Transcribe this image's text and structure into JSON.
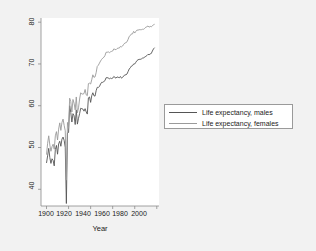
{
  "chart_data": {
    "type": "line",
    "title": "",
    "subtitle": "",
    "xlabel": "Year",
    "ylabel": "",
    "xlim": [
      1895,
      2002
    ],
    "ylim": [
      36,
      81
    ],
    "grid": false,
    "legend_position": "right",
    "xticks": [
      1900,
      1920,
      1940,
      1960,
      1980,
      2000
    ],
    "yticks": [
      40,
      50,
      60,
      70,
      80
    ],
    "xtick_labels": [
      "1900",
      "1920",
      "1940",
      "1960",
      "1980",
      "2000"
    ],
    "ytick_labels": [
      "40",
      "50",
      "60",
      "70",
      "80"
    ],
    "series": [
      {
        "name": "Life expectancy, males",
        "color": "#555555",
        "x": [
          1900,
          1901,
          1902,
          1903,
          1904,
          1905,
          1906,
          1907,
          1908,
          1909,
          1910,
          1911,
          1912,
          1913,
          1914,
          1915,
          1916,
          1917,
          1918,
          1919,
          1920,
          1921,
          1922,
          1923,
          1924,
          1925,
          1926,
          1927,
          1928,
          1929,
          1930,
          1931,
          1932,
          1933,
          1934,
          1935,
          1936,
          1937,
          1938,
          1939,
          1940,
          1941,
          1942,
          1943,
          1944,
          1945,
          1946,
          1947,
          1948,
          1949,
          1950,
          1951,
          1952,
          1953,
          1954,
          1955,
          1956,
          1957,
          1958,
          1959,
          1960,
          1961,
          1962,
          1963,
          1964,
          1965,
          1966,
          1967,
          1968,
          1969,
          1970,
          1971,
          1972,
          1973,
          1974,
          1975,
          1976,
          1977,
          1978,
          1979,
          1980,
          1981,
          1982,
          1983,
          1984,
          1985,
          1986,
          1987,
          1988,
          1989,
          1990,
          1991,
          1992,
          1993,
          1994,
          1995,
          1996,
          1997,
          1998
        ],
        "y": [
          46.3,
          48.0,
          49.8,
          47.6,
          46.2,
          47.3,
          46.9,
          45.6,
          49.5,
          50.5,
          48.4,
          50.9,
          51.5,
          50.3,
          52.0,
          52.5,
          51.7,
          50.0,
          36.6,
          53.5,
          53.6,
          60.0,
          58.4,
          56.1,
          58.1,
          57.6,
          55.5,
          59.0,
          55.6,
          57.0,
          58.1,
          59.4,
          59.3,
          59.2,
          58.7,
          59.3,
          58.5,
          58.0,
          61.9,
          62.1,
          60.8,
          62.4,
          63.1,
          62.4,
          62.3,
          63.6,
          64.4,
          64.4,
          64.6,
          65.2,
          65.6,
          65.6,
          65.8,
          66.0,
          66.7,
          66.7,
          66.7,
          66.4,
          66.6,
          66.5,
          66.6,
          67.0,
          66.8,
          66.6,
          66.9,
          66.8,
          66.7,
          67.0,
          66.6,
          66.8,
          67.1,
          67.4,
          67.4,
          67.6,
          68.2,
          68.8,
          69.1,
          69.5,
          69.6,
          70.0,
          70.0,
          70.4,
          70.8,
          71.0,
          71.1,
          71.1,
          71.2,
          71.4,
          71.4,
          71.7,
          71.8,
          72.0,
          72.3,
          72.2,
          72.4,
          72.5,
          73.1,
          73.6,
          73.9
        ],
        "linewidth": 0.9
      },
      {
        "name": "Life expectancy, females",
        "color": "#9a9a9a",
        "x": [
          1900,
          1901,
          1902,
          1903,
          1904,
          1905,
          1906,
          1907,
          1908,
          1909,
          1910,
          1911,
          1912,
          1913,
          1914,
          1915,
          1916,
          1917,
          1918,
          1919,
          1920,
          1921,
          1922,
          1923,
          1924,
          1925,
          1926,
          1927,
          1928,
          1929,
          1930,
          1931,
          1932,
          1933,
          1934,
          1935,
          1936,
          1937,
          1938,
          1939,
          1940,
          1941,
          1942,
          1943,
          1944,
          1945,
          1946,
          1947,
          1948,
          1949,
          1950,
          1951,
          1952,
          1953,
          1954,
          1955,
          1956,
          1957,
          1958,
          1959,
          1960,
          1961,
          1962,
          1963,
          1964,
          1965,
          1966,
          1967,
          1968,
          1969,
          1970,
          1971,
          1972,
          1973,
          1974,
          1975,
          1976,
          1977,
          1978,
          1979,
          1980,
          1981,
          1982,
          1983,
          1984,
          1985,
          1986,
          1987,
          1988,
          1989,
          1990,
          1991,
          1992,
          1993,
          1994,
          1995,
          1996,
          1997,
          1998
        ],
        "y": [
          48.3,
          51.0,
          52.8,
          50.6,
          49.1,
          50.2,
          50.8,
          49.6,
          52.8,
          53.8,
          51.8,
          54.4,
          55.9,
          54.1,
          56.0,
          56.8,
          55.3,
          54.0,
          42.2,
          56.0,
          54.6,
          61.8,
          61.0,
          58.5,
          61.5,
          60.6,
          59.0,
          62.1,
          58.3,
          59.5,
          61.6,
          63.1,
          62.8,
          62.8,
          62.9,
          63.9,
          62.6,
          62.4,
          65.3,
          65.4,
          65.2,
          66.2,
          67.4,
          66.8,
          66.9,
          67.9,
          69.4,
          69.7,
          70.2,
          70.7,
          71.1,
          71.4,
          71.6,
          72.0,
          72.8,
          72.8,
          72.9,
          72.7,
          72.9,
          73.0,
          73.1,
          73.6,
          73.5,
          73.4,
          73.7,
          73.8,
          73.8,
          74.2,
          74.1,
          74.3,
          74.7,
          75.0,
          75.1,
          75.3,
          75.9,
          76.6,
          76.8,
          77.2,
          77.2,
          77.8,
          77.4,
          77.8,
          78.1,
          78.1,
          78.2,
          78.2,
          78.2,
          78.3,
          78.3,
          78.5,
          78.8,
          78.9,
          79.1,
          78.8,
          79.0,
          78.9,
          79.1,
          79.4,
          79.5
        ],
        "linewidth": 0.9
      }
    ],
    "axis_color": "#8c8c8c",
    "panel_color": "#ffffff",
    "page_color": "#f2f2f2"
  },
  "axes": {
    "x_title": "Year",
    "x_tick_labels": [
      "1900",
      "1920",
      "1940",
      "1960",
      "1980",
      "2000"
    ],
    "y_tick_labels": [
      "40",
      "50",
      "60",
      "70",
      "80"
    ]
  },
  "legend": {
    "entries": [
      {
        "label": "Life expectancy, males",
        "color": "#555555"
      },
      {
        "label": "Life expectancy, females",
        "color": "#9a9a9a"
      }
    ]
  }
}
